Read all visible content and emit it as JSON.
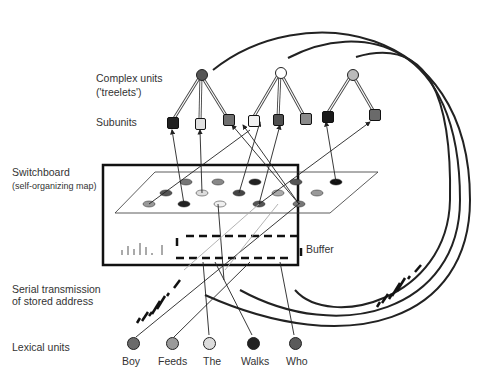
{
  "labels": {
    "complex_units": "Complex units",
    "treelets": "('treelets')",
    "subunits": "Subunits",
    "switchboard": "Switchboard",
    "switchboard_sub": "(self-organizing map)",
    "buffer": "Buffer",
    "serial_1": "Serial transmission",
    "serial_2": "of stored address",
    "lexical_units": "Lexical units"
  },
  "lexical_units": [
    {
      "label": "Boy",
      "color": "#6a6a6a"
    },
    {
      "label": "Feeds",
      "color": "#9a9a9a"
    },
    {
      "label": "The",
      "color": "#dcdcdc"
    },
    {
      "label": "Walks",
      "color": "#222222"
    },
    {
      "label": "Who",
      "color": "#5a5a5a"
    }
  ],
  "complex_units": [
    {
      "color": "#555555",
      "subunit_colors": [
        "#222222",
        "#e0e0e0",
        "#707070"
      ]
    },
    {
      "color": "#ffffff",
      "subunit_colors": [
        "#f0f0f0",
        "#505050",
        "#8a8a8a"
      ]
    },
    {
      "color": "#bbbbbb",
      "subunit_colors": [
        "#1a1a1a",
        "#6a6a6a"
      ]
    }
  ]
}
